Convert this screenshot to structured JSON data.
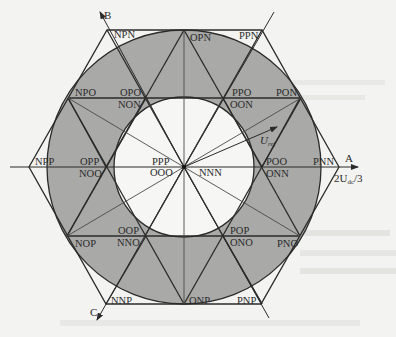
{
  "figure": {
    "colors": {
      "background": "#f3f3f1",
      "ring_fill": "#a9a9a7",
      "inner_fill": "#f6f6f4",
      "line": "#2b2b2b"
    },
    "axes": {
      "a": {
        "label": "A",
        "magnitude_label": "2U_dc/3",
        "magnitude_main": "2U",
        "magnitude_sub": "dc",
        "magnitude_tail": "/3"
      },
      "b": {
        "label": "B"
      },
      "c": {
        "label": "C"
      }
    },
    "reference_vector": {
      "label_main": "U",
      "label_sub": "ref"
    },
    "center": {
      "labels": [
        "PPP",
        "OOO",
        "NNN"
      ]
    },
    "large_vectors": [
      {
        "name": "PNN"
      },
      {
        "name": "PPN"
      },
      {
        "name": "NPN"
      },
      {
        "name": "NPP"
      },
      {
        "name": "NNP"
      },
      {
        "name": "PNP"
      }
    ],
    "medium_vectors": [
      {
        "name": "PON"
      },
      {
        "name": "OPN"
      },
      {
        "name": "NPO"
      },
      {
        "name": "NOP"
      },
      {
        "name": "ONP"
      },
      {
        "name": "PNO"
      }
    ],
    "small_vectors": [
      {
        "upper": "POO",
        "lower": "ONN"
      },
      {
        "upper": "PPO",
        "lower": "OON"
      },
      {
        "upper": "OPO",
        "lower": "NON"
      },
      {
        "upper": "OPP",
        "lower": "NOO"
      },
      {
        "upper": "OOP",
        "lower": "NNO"
      },
      {
        "upper": "POP",
        "lower": "ONO"
      }
    ]
  }
}
